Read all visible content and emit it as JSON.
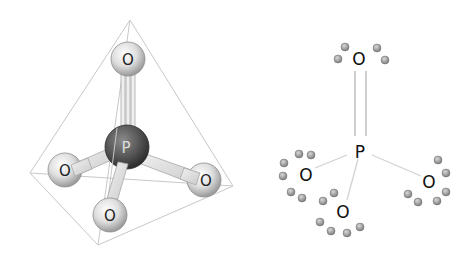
{
  "diagram": {
    "colors": {
      "tetrahedron_edge": "#c8c8c8",
      "oxygen_sphere_light": "#fafafa",
      "oxygen_sphere_dark": "#9a9a9a",
      "phosphorus_sphere_light": "#8a8a8a",
      "phosphorus_sphere_dark": "#3a3a3a",
      "bond_rod": "#e4e4e4",
      "lewis_bond": "#bdbdbd",
      "lone_pair_dot": "#9c9c9c"
    },
    "model_3d": {
      "central_atom": {
        "label": "P"
      },
      "outer_atoms": [
        {
          "label": "O",
          "position": "top",
          "bond": "double"
        },
        {
          "label": "O",
          "position": "left",
          "bond": "single"
        },
        {
          "label": "O",
          "position": "right",
          "bond": "single"
        },
        {
          "label": "O",
          "position": "bottom",
          "bond": "single"
        }
      ]
    },
    "lewis_structure": {
      "central_atom": {
        "label": "P"
      },
      "outer_atoms": [
        {
          "label": "O",
          "position": "top",
          "bond": "double",
          "lone_pair_electrons": 4
        },
        {
          "label": "O",
          "position": "left",
          "bond": "single",
          "lone_pair_electrons": 6
        },
        {
          "label": "O",
          "position": "bottom",
          "bond": "single",
          "lone_pair_electrons": 6
        },
        {
          "label": "O",
          "position": "right",
          "bond": "single",
          "lone_pair_electrons": 6
        }
      ]
    }
  }
}
